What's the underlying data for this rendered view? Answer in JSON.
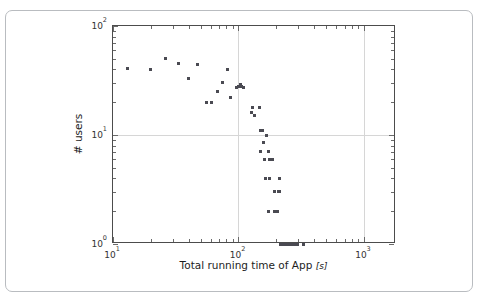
{
  "figure": {
    "background_color": "#ffffff",
    "card_border_color": "#b9bcc0",
    "axis_color": "#4c4c4c",
    "grid_color": "#d6d6d6",
    "marker_color": "#4a4a52"
  },
  "chart_data": {
    "type": "scatter",
    "title": "",
    "xlabel": "Total running time of App [s]",
    "xlabel_text": "Total running time of App",
    "xlabel_unit": "[s]",
    "ylabel": "# users",
    "xscale": "log",
    "yscale": "log",
    "xlim": [
      10,
      1800
    ],
    "ylim": [
      1,
      100
    ],
    "grid": true,
    "legend": null,
    "xtick_labels": [
      "10",
      "10",
      "10"
    ],
    "xtick_exponents": [
      "1",
      "2",
      "3"
    ],
    "xtick_values": [
      10,
      100,
      1000
    ],
    "ytick_labels": [
      "10",
      "10",
      "10"
    ],
    "ytick_exponents": [
      "0",
      "1",
      "2"
    ],
    "ytick_values": [
      1,
      10,
      100
    ],
    "points": [
      [
        13,
        41
      ],
      [
        20,
        40
      ],
      [
        26,
        50
      ],
      [
        33,
        45
      ],
      [
        40,
        33
      ],
      [
        47,
        44
      ],
      [
        56,
        20
      ],
      [
        61,
        20
      ],
      [
        68,
        25
      ],
      [
        74,
        30
      ],
      [
        82,
        40
      ],
      [
        87,
        22
      ],
      [
        97,
        27
      ],
      [
        100,
        28
      ],
      [
        103,
        29
      ],
      [
        106,
        28
      ],
      [
        109,
        27
      ],
      [
        126,
        16
      ],
      [
        129,
        18
      ],
      [
        133,
        15
      ],
      [
        148,
        18
      ],
      [
        150,
        11
      ],
      [
        153,
        11
      ],
      [
        156,
        11
      ],
      [
        166,
        10
      ],
      [
        150,
        7
      ],
      [
        158,
        8.5
      ],
      [
        162,
        6
      ],
      [
        172,
        7
      ],
      [
        176,
        6
      ],
      [
        186,
        6
      ],
      [
        163,
        4
      ],
      [
        178,
        4
      ],
      [
        212,
        4
      ],
      [
        192,
        3
      ],
      [
        208,
        3
      ],
      [
        212,
        3
      ],
      [
        175,
        2
      ],
      [
        192,
        2
      ],
      [
        196,
        2
      ],
      [
        206,
        2
      ],
      [
        218,
        1
      ],
      [
        228,
        1
      ],
      [
        236,
        1
      ],
      [
        242,
        1
      ],
      [
        248,
        1
      ],
      [
        252,
        1
      ],
      [
        258,
        1
      ],
      [
        264,
        1
      ],
      [
        270,
        1
      ],
      [
        276,
        1
      ],
      [
        282,
        1
      ],
      [
        290,
        1
      ],
      [
        296,
        1
      ],
      [
        332,
        1
      ]
    ]
  }
}
